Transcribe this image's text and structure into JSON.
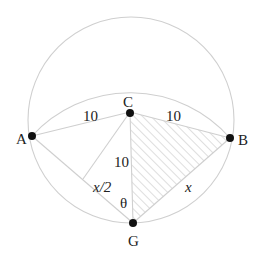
{
  "diagram": {
    "type": "geometry",
    "colors": {
      "background": "#ffffff",
      "lines": "#cfcfcf",
      "hatch": "#c8c8c8",
      "points": "#111111",
      "text": "#222222"
    },
    "points": {
      "A": {
        "label": "A",
        "x": 32,
        "y": 136
      },
      "B": {
        "label": "B",
        "x": 230,
        "y": 138
      },
      "C": {
        "label": "C",
        "x": 130,
        "y": 112
      },
      "G": {
        "label": "G",
        "x": 133,
        "y": 223
      }
    },
    "circles": [
      {
        "name": "outer-circle",
        "cx": 131,
        "cy": 120,
        "r": 103
      },
      {
        "name": "arc-centered-at-G",
        "cx": 133,
        "cy": 223,
        "r": 133,
        "visible": "upper arc from A to B"
      }
    ],
    "segments": [
      {
        "from": "A",
        "to": "C",
        "label": "10"
      },
      {
        "from": "C",
        "to": "B",
        "label": "10"
      },
      {
        "from": "C",
        "to": "G",
        "label": "10"
      },
      {
        "from": "A",
        "to": "G",
        "label": "x/2",
        "note": "label on half of AG"
      },
      {
        "from": "G",
        "to": "B",
        "label": "x"
      },
      {
        "from": "C",
        "to": "midpoint of AG"
      }
    ],
    "shaded_region": "triangle CBG (hatched)",
    "angle": {
      "label": "θ",
      "at": "G",
      "between": "GC and GA"
    },
    "labels": {
      "A": "A",
      "B": "B",
      "C": "C",
      "G": "G",
      "ac": "10",
      "cb": "10",
      "cg": "10",
      "half_ag": "x/2",
      "gb": "x",
      "theta": "θ"
    }
  }
}
